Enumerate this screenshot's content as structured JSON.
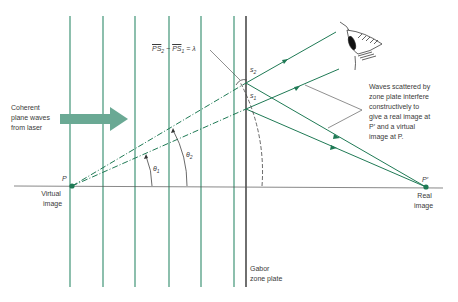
{
  "diagram": {
    "colors": {
      "wave_lines": "#2e8a6a",
      "rays": "#1f7a55",
      "zone_plate": "#333333",
      "axis": "#555555",
      "arrow": "#6aa994",
      "text": "#3a3a3a"
    },
    "labels": {
      "equation": "PS₂ − PS₁ = λ",
      "equation_parts": {
        "a": "PS",
        "a_sub": "2",
        "minus": "−",
        "b": "PS",
        "b_sub": "1",
        "eq": "= λ"
      },
      "coherent_line1": "Coherent",
      "coherent_line2": "plane waves",
      "coherent_line3": "from laser",
      "s2": "s",
      "s2_sub": "2",
      "s1": "s",
      "s1_sub": "1",
      "theta1": "θ",
      "theta1_sub": "1",
      "theta2": "θ",
      "theta2_sub": "2",
      "P": "P",
      "virtual_line1": "Virtual",
      "virtual_line2": "image",
      "P_prime": "P′",
      "real_line1": "Real",
      "real_line2": "image",
      "gabor_line1": "Gabor",
      "gabor_line2": "zone plate",
      "waves_line1": "Waves scattered by",
      "waves_line2": "zone plate interfere",
      "waves_line3": "constructively to",
      "waves_line4": "give a real image at",
      "waves_line5": "P′ and a virtual",
      "waves_line6": "image at P."
    },
    "icons": {
      "eye": "eye-icon",
      "arrow": "right-arrow-icon"
    }
  }
}
